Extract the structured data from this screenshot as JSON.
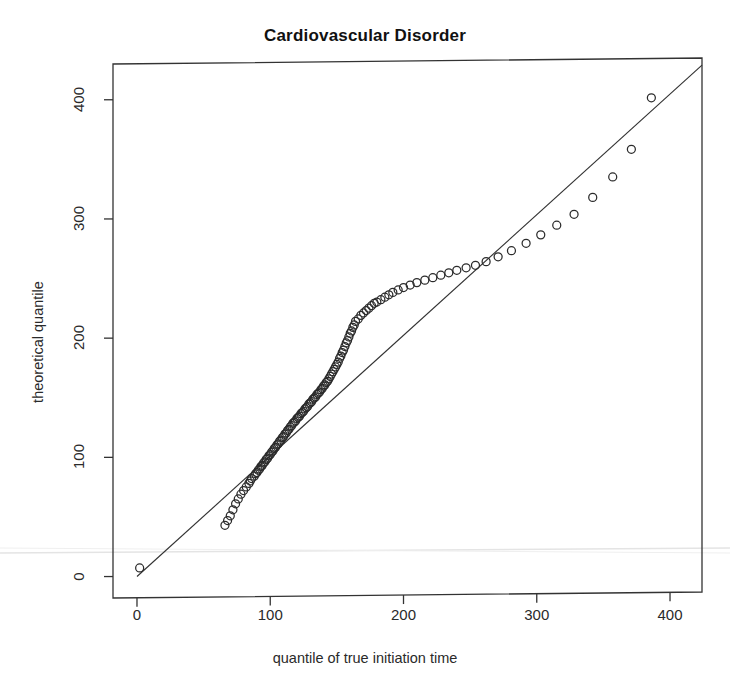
{
  "figure": {
    "background": "#ffffff",
    "ink_color": "#333333",
    "scan_artifact_color": "#e2e2e2"
  },
  "chart_data": {
    "type": "scatter",
    "title": "Cardiovascular Disorder",
    "xlabel": "quantile of true initiation time",
    "ylabel": "theoretical quantile",
    "xlim": [
      -18,
      424
    ],
    "ylim": [
      -18,
      430
    ],
    "xticks": [
      0,
      100,
      200,
      300,
      400
    ],
    "yticks": [
      0,
      100,
      200,
      300,
      400
    ],
    "xtick_labels": [
      "0",
      "100",
      "200",
      "300",
      "400"
    ],
    "ytick_labels": [
      "0",
      "100",
      "200",
      "300",
      "400"
    ],
    "grid": false,
    "legend": null,
    "marker": "open-circle",
    "reference_line": {
      "label": "identity line",
      "slope": 1.0,
      "intercept": 0,
      "x_start": 0,
      "y_start": 0,
      "x_end": 424,
      "y_end": 424
    },
    "series": [
      {
        "name": "Q-Q points",
        "x": [
          2,
          66,
          68,
          70,
          72,
          74,
          76,
          78,
          80,
          82,
          84,
          85,
          86,
          88,
          89,
          90,
          91,
          92,
          93,
          94,
          95,
          96,
          97,
          98,
          99,
          100,
          101,
          102,
          103,
          104,
          105,
          106,
          107,
          108,
          109,
          110,
          111,
          112,
          113,
          114,
          115,
          116,
          117,
          118,
          119,
          120,
          121,
          122,
          123,
          124,
          125,
          126,
          127,
          128,
          129,
          130,
          131,
          132,
          133,
          134,
          135,
          136,
          137,
          138,
          139,
          140,
          141,
          142,
          143,
          144,
          145,
          146,
          147,
          148,
          149,
          150,
          151,
          152,
          153,
          154,
          155,
          156,
          157,
          158,
          159,
          160,
          161,
          162,
          163,
          164,
          166,
          168,
          170,
          172,
          174,
          176,
          178,
          180,
          183,
          186,
          189,
          192,
          196,
          200,
          205,
          210,
          216,
          222,
          228,
          234,
          240,
          247,
          254,
          262,
          271,
          281,
          292,
          303,
          315,
          328,
          342,
          357,
          371,
          386
        ],
        "y": [
          7,
          42,
          46,
          50,
          55,
          60,
          64,
          68,
          71,
          74,
          77,
          79,
          81,
          83,
          85,
          86,
          88,
          89,
          91,
          92,
          94,
          95,
          97,
          98,
          100,
          101,
          103,
          104,
          106,
          107,
          109,
          110,
          112,
          113,
          115,
          116,
          118,
          119,
          121,
          122,
          124,
          125,
          127,
          128,
          129,
          131,
          132,
          133,
          135,
          136,
          137,
          139,
          140,
          141,
          143,
          144,
          145,
          147,
          148,
          149,
          151,
          152,
          153,
          155,
          156,
          158,
          159,
          161,
          162,
          164,
          166,
          168,
          170,
          172,
          174,
          176,
          178,
          181,
          183,
          186,
          188,
          191,
          194,
          196,
          199,
          202,
          204,
          207,
          209,
          212,
          214,
          217,
          219,
          221,
          223,
          225,
          227,
          228,
          230,
          232,
          234,
          236,
          238,
          240,
          242,
          244,
          246,
          248,
          250,
          252,
          254,
          256,
          258,
          261,
          265,
          270,
          276,
          283,
          291,
          300,
          314,
          331,
          354,
          397
        ]
      }
    ],
    "annotations": [
      {
        "text": "single low outlier near origin",
        "x": 2,
        "y": 7
      },
      {
        "text": "upper tail falls below identity line",
        "x": 340,
        "y": 300
      }
    ]
  }
}
